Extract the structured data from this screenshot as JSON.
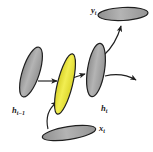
{
  "figure": {
    "type": "rnn-unit-diagram",
    "background_color": "#ffffff",
    "stroke_color": "#1f1f1f",
    "node_fill_gray": "#a9a9a9",
    "node_fill_yellow": "#e9e437",
    "nodes": [
      {
        "id": "h-prev",
        "label_main": "h",
        "label_sub": "t−1",
        "color": "#a9a9a9",
        "shape": "ellipse",
        "cx": 31,
        "cy": 72,
        "rx": 8.5,
        "ry": 26,
        "rotate": 18
      },
      {
        "id": "gate",
        "label_main": "",
        "label_sub": "",
        "color": "#e9e437",
        "shape": "ellipse",
        "cx": 65,
        "cy": 84,
        "rx": 7.5,
        "ry": 31,
        "rotate": 14
      },
      {
        "id": "h-t",
        "label_main": "h",
        "label_sub": "t",
        "color": "#a9a9a9",
        "shape": "ellipse",
        "cx": 96,
        "cy": 70,
        "rx": 8.5,
        "ry": 27,
        "rotate": 9
      },
      {
        "id": "y-t",
        "label_main": "y",
        "label_sub": "t",
        "color": "#a9a9a9",
        "shape": "ellipse",
        "cx": 123,
        "cy": 14,
        "rx": 25,
        "ry": 6.5,
        "rotate": -3
      },
      {
        "id": "x-t",
        "label_main": "x",
        "label_sub": "t",
        "color": "#a9a9a9",
        "shape": "ellipse",
        "cx": 69,
        "cy": 133,
        "rx": 27,
        "ry": 6.5,
        "rotate": -9
      }
    ],
    "labels": [
      {
        "id": "label-h-prev",
        "main": "h",
        "sub": "t−1",
        "x": 12,
        "y": 112
      },
      {
        "id": "label-h-t",
        "main": "h",
        "sub": "t",
        "x": 101,
        "y": 110
      },
      {
        "id": "label-x-t",
        "main": "x",
        "sub": "t",
        "x": 98,
        "y": 130
      },
      {
        "id": "label-y-t",
        "main": "y",
        "sub": "t",
        "x": 92,
        "y": 12
      }
    ],
    "edges": [
      {
        "id": "edge-hprev-to-gate",
        "from": "h-prev",
        "to": "gate",
        "style": "straight",
        "arrow": true
      },
      {
        "id": "edge-gate-to-ht",
        "from": "gate",
        "to": "h-t",
        "style": "straight",
        "arrow": true
      },
      {
        "id": "edge-xt-to-gate",
        "from": "x-t",
        "to": "gate",
        "style": "curved",
        "arrow": true
      },
      {
        "id": "edge-ht-to-yt",
        "from": "h-t",
        "to": "y-t",
        "style": "curved",
        "arrow": true
      },
      {
        "id": "edge-ht-to-next",
        "from": "h-t",
        "to": "offscreen-right",
        "style": "curved",
        "arrow": true
      }
    ]
  }
}
